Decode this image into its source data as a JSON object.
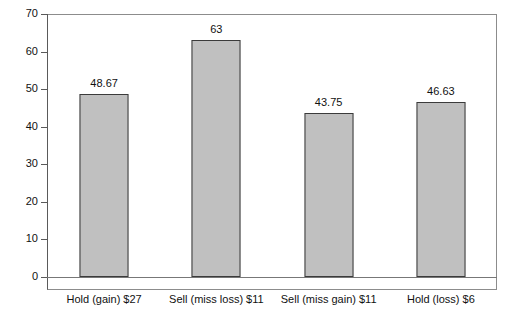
{
  "chart_data": {
    "type": "bar",
    "title": "",
    "subtitle": "",
    "xlabel": "",
    "ylabel": "",
    "ylim": [
      0,
      70
    ],
    "ytick_step": 10,
    "yticks": [
      "0",
      "10",
      "20",
      "30",
      "40",
      "50",
      "60",
      "70"
    ],
    "grid": false,
    "legend": "none",
    "categories": [
      "Hold (gain) $27",
      "Sell (miss loss) $11",
      "Sell (miss gain) $11",
      "Hold (loss) $6"
    ],
    "values": [
      48.67,
      63,
      43.75,
      46.63
    ],
    "value_labels": [
      "48.67",
      "63",
      "43.75",
      "46.63"
    ],
    "colors": {
      "bar_fill": "#c0c0c0",
      "bar_border": "#3b3b3b",
      "axis": "#5a5a5a",
      "frame": "#8c8c8c",
      "text": "#111111",
      "background": "#ffffff"
    }
  }
}
